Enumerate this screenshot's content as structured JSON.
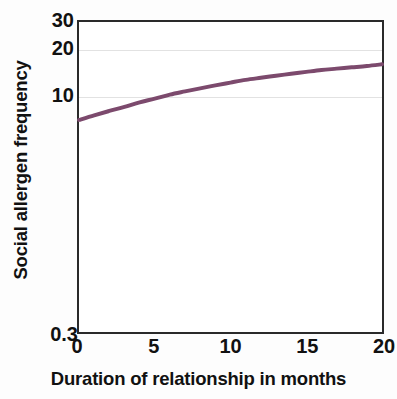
{
  "chart_data": {
    "type": "line",
    "title": "",
    "xlabel": "Duration of relationship in months",
    "ylabel": "Social allergen frequency",
    "xlim": [
      0,
      20
    ],
    "ylim": [
      0.3,
      30
    ],
    "yscale": "log",
    "xscale": "linear",
    "grid": "horizontal",
    "gridlines_y": [
      10,
      20
    ],
    "legend": "none",
    "xticks": [
      {
        "value": 0,
        "label": "0"
      },
      {
        "value": 5,
        "label": "5"
      },
      {
        "value": 10,
        "label": "10"
      },
      {
        "value": 15,
        "label": "15"
      },
      {
        "value": 20,
        "label": "20"
      }
    ],
    "yticks": [
      {
        "value": 30,
        "label": "30"
      },
      {
        "value": 20,
        "label": "20"
      },
      {
        "value": 10,
        "label": "10"
      },
      {
        "value": 0.3,
        "label": "0.3"
      }
    ],
    "series": [
      {
        "name": "Social allergen frequency",
        "color": "#7c4a6d",
        "linewidth": 4,
        "x": [
          0,
          1,
          2,
          3,
          4,
          5,
          6,
          7,
          8,
          9,
          10,
          11,
          12,
          13,
          14,
          15,
          16,
          17,
          18,
          19,
          20
        ],
        "values": [
          7.0,
          7.5,
          8.0,
          8.5,
          9.1,
          9.6,
          10.2,
          10.7,
          11.2,
          11.7,
          12.2,
          12.7,
          13.1,
          13.5,
          13.9,
          14.3,
          14.7,
          15.0,
          15.3,
          15.6,
          16.0
        ]
      }
    ]
  },
  "axes": {
    "y_title": "Social allergen frequency",
    "x_title": "Duration of relationship in months"
  },
  "colors": {
    "curve": "#7c4a6d",
    "frame": "#2a2a2a",
    "grid": "#e2e2e2",
    "text": "#111111",
    "plot_background": "#ffffff",
    "figure_background": "#fdfdfd"
  }
}
